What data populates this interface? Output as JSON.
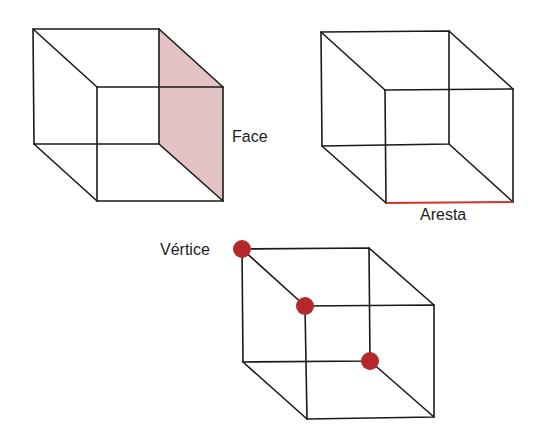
{
  "diagram": {
    "colors": {
      "edge": "#1a1a1a",
      "face_fill": "#e3c3c4",
      "highlight_edge": "#d0342c",
      "vertex_dot": "#b5282a",
      "label": "#222222"
    },
    "cubes": [
      {
        "id": "face-cube",
        "label": "Face",
        "highlight": "face"
      },
      {
        "id": "edge-cube",
        "label": "Aresta",
        "highlight": "edge"
      },
      {
        "id": "vertex-cube",
        "label": "Vértice",
        "highlight": "vertices",
        "vertex_count_marked": 3
      }
    ]
  }
}
